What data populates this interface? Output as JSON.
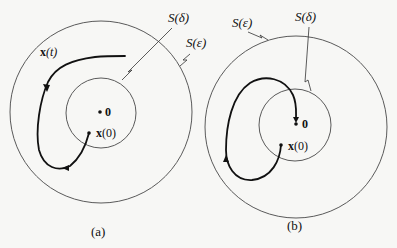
{
  "panels": [
    {
      "caption": "(a)",
      "labels": {
        "trajectory": "x(t)",
        "trajectory_bold": "x",
        "trajectory_arg": "(t)",
        "inner_set": "S(δ)",
        "outer_set": "S(ε)",
        "origin": "0",
        "initial_bold": "x",
        "initial_arg": "(0)"
      }
    },
    {
      "caption": "(b)",
      "labels": {
        "inner_set": "S(δ)",
        "outer_set": "S(ε)",
        "origin": "0",
        "initial_bold": "x",
        "initial_arg": "(0)"
      }
    }
  ],
  "colors": {
    "stroke": "#111111",
    "circle": "#5a5a5a",
    "background": "#f7f7f5"
  }
}
